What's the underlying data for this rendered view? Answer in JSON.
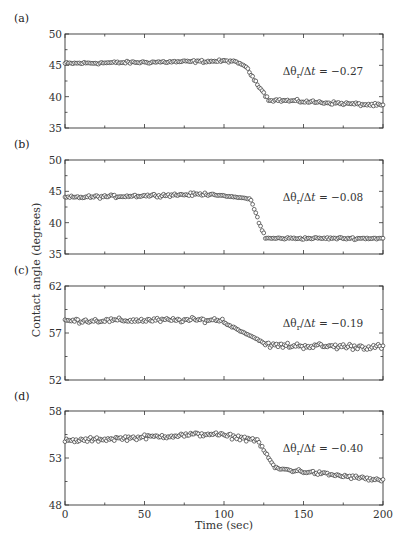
{
  "chart_data": {
    "type": "scatter",
    "xlabel": "Time (sec)",
    "ylabel": "Contact angle (degrees)",
    "xlim": [
      0,
      200
    ],
    "xticks": [
      0,
      50,
      100,
      150,
      200
    ],
    "xtick_labels": [
      "0",
      "50",
      "100",
      "150",
      "200"
    ],
    "grid": false,
    "marker": "open-circle",
    "panels": [
      {
        "label": "(a)",
        "ylim": [
          35,
          50
        ],
        "yticks": [
          35,
          40,
          45,
          50
        ],
        "ytick_labels": [
          "35",
          "40",
          "45",
          "50"
        ],
        "annotation": "Δθr/Δt = −0.27",
        "annotation_parts": {
          "pre": "Δθ",
          "sub": "r",
          "post": "/Δ",
          "ital": "t",
          "tail": " = −0.27"
        },
        "segments": [
          {
            "t0": 0,
            "t1": 105,
            "y0": 45.3,
            "y1": 45.7,
            "noise": 0.3
          },
          {
            "t0": 105,
            "t1": 113,
            "y0": 45.7,
            "y1": 45.0,
            "noise": 0.2
          },
          {
            "t0": 113,
            "t1": 128,
            "y0": 45.0,
            "y1": 39.5,
            "noise": 0.3
          },
          {
            "t0": 128,
            "t1": 200,
            "y0": 39.5,
            "y1": 38.6,
            "noise": 0.35
          }
        ]
      },
      {
        "label": "(b)",
        "ylim": [
          35,
          50
        ],
        "yticks": [
          35,
          40,
          45,
          50
        ],
        "ytick_labels": [
          "35",
          "40",
          "45",
          "50"
        ],
        "annotation": "Δθr/Δt = −0.08",
        "annotation_parts": {
          "pre": "Δθ",
          "sub": "r",
          "post": "/Δ",
          "ital": "t",
          "tail": " = −0.08"
        },
        "segments": [
          {
            "t0": 0,
            "t1": 95,
            "y0": 44.0,
            "y1": 44.6,
            "noise": 0.35
          },
          {
            "t0": 95,
            "t1": 117,
            "y0": 44.4,
            "y1": 43.8,
            "noise": 0.1
          },
          {
            "t0": 117,
            "t1": 126,
            "y0": 43.5,
            "y1": 37.5,
            "noise": 0.4
          },
          {
            "t0": 126,
            "t1": 200,
            "y0": 37.5,
            "y1": 37.5,
            "noise": 0.25
          }
        ]
      },
      {
        "label": "(c)",
        "ylim": [
          52,
          62
        ],
        "yticks": [
          52,
          57,
          62
        ],
        "ytick_labels": [
          "52",
          "57",
          "62"
        ],
        "annotation": "Δθr/Δt = −0.19",
        "annotation_parts": {
          "pre": "Δθ",
          "sub": "r",
          "post": "/Δ",
          "ital": "t",
          "tail": " = −0.19"
        },
        "segments": [
          {
            "t0": 0,
            "t1": 100,
            "y0": 58.3,
            "y1": 58.4,
            "noise": 0.35
          },
          {
            "t0": 100,
            "t1": 125,
            "y0": 58.1,
            "y1": 56.0,
            "noise": 0.1
          },
          {
            "t0": 125,
            "t1": 200,
            "y0": 55.7,
            "y1": 55.5,
            "noise": 0.45
          }
        ]
      },
      {
        "label": "(d)",
        "ylim": [
          48,
          58
        ],
        "yticks": [
          48,
          53,
          58
        ],
        "ytick_labels": [
          "48",
          "53",
          "58"
        ],
        "annotation": "Δθr/Δt = −0.40",
        "annotation_parts": {
          "pre": "Δθ",
          "sub": "r",
          "post": "/Δ",
          "ital": "t",
          "tail": " = −0.40"
        },
        "segments": [
          {
            "t0": 0,
            "t1": 95,
            "y0": 54.8,
            "y1": 55.6,
            "noise": 0.35
          },
          {
            "t0": 95,
            "t1": 122,
            "y0": 55.5,
            "y1": 54.9,
            "noise": 0.35
          },
          {
            "t0": 122,
            "t1": 132,
            "y0": 54.6,
            "y1": 52.0,
            "noise": 0.2
          },
          {
            "t0": 132,
            "t1": 200,
            "y0": 51.9,
            "y1": 50.6,
            "noise": 0.3
          }
        ]
      }
    ],
    "sample_interval_sec": 1
  }
}
